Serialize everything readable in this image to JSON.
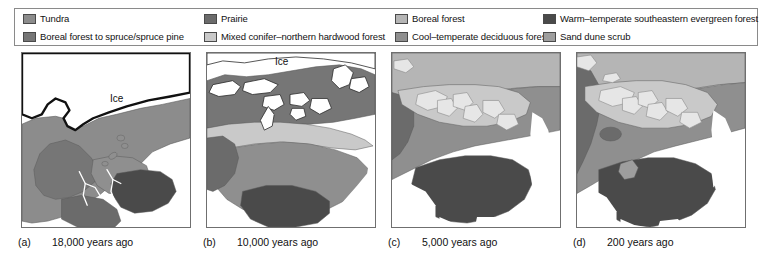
{
  "figure": {
    "legend": {
      "items": [
        {
          "label": "Tundra",
          "color": "#8c8c8c",
          "row": 0,
          "col": 0
        },
        {
          "label": "Prairie",
          "color": "#6b6b6b",
          "row": 0,
          "col": 1
        },
        {
          "label": "Boreal forest",
          "color": "#b5b5b5",
          "row": 0,
          "col": 2
        },
        {
          "label": "Warm–temperate southeastern evergreen forest",
          "color": "#4a4a4a",
          "row": 0,
          "col": 3
        },
        {
          "label": "Boreal forest to spruce/spruce pine",
          "color": "#767676",
          "row": 1,
          "col": 0
        },
        {
          "label": "Mixed conifer–northern hardwood forest",
          "color": "#c9c9c9",
          "row": 1,
          "col": 1
        },
        {
          "label": "Cool–temperate deciduous forest",
          "color": "#8f8f8f",
          "row": 1,
          "col": 2
        },
        {
          "label": "Sand dune scrub",
          "color": "#9e9e9e",
          "row": 1,
          "col": 3
        }
      ]
    },
    "panels": [
      {
        "tag": "(a)",
        "caption": "18,000 years ago",
        "ice_label": "Ice"
      },
      {
        "tag": "(b)",
        "caption": "10,000 years ago",
        "ice_label": "Ice"
      },
      {
        "tag": "(c)",
        "caption": "5,000 years ago",
        "ice_label": ""
      },
      {
        "tag": "(d)",
        "caption": "200 years ago",
        "ice_label": ""
      }
    ]
  },
  "colors": {
    "tundra": "#8c8c8c",
    "prairie": "#6b6b6b",
    "boreal_forest": "#b5b5b5",
    "warm_temperate_evergreen": "#4a4a4a",
    "boreal_to_spruce": "#767676",
    "mixed_conifer_hardwood": "#c9c9c9",
    "cool_temperate_deciduous": "#8f8f8f",
    "sand_dune_scrub": "#9e9e9e",
    "ice": "#ffffff",
    "ice_margin": "#111111",
    "ocean": "#ffffff",
    "outline": "#5a5a5a",
    "frame": "#6f6f6f",
    "legend_border": "#8a8a8a"
  }
}
